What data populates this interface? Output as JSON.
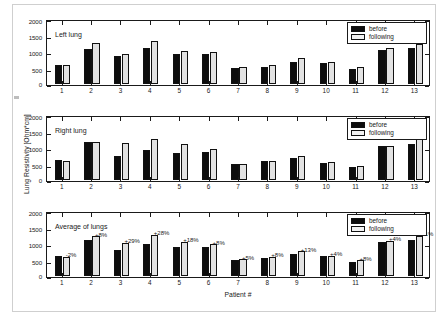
{
  "figure": {
    "yaxis_title": "Lung Resistivity [Ohm*cm]",
    "xaxis_title": "Patient #"
  },
  "legend": {
    "before_label": "before",
    "following_label": "following"
  },
  "panels": [
    {
      "title": "Left lung"
    },
    {
      "title": "Right lung"
    },
    {
      "title": "Average of lungs"
    }
  ],
  "chart_data": [
    {
      "type": "bar",
      "title": "Left lung",
      "xlabel": "Patient #",
      "ylabel": "Lung Resistivity [Ohm*cm]",
      "ylim": [
        0,
        2000
      ],
      "yticks": [
        0,
        500,
        1000,
        1500,
        2000
      ],
      "ytick_labels": [
        "0",
        "500",
        "1000",
        "1500",
        "2000"
      ],
      "categories": [
        "1",
        "2",
        "3",
        "4",
        "5",
        "6",
        "7",
        "8",
        "9",
        "10",
        "11",
        "12",
        "13"
      ],
      "grid": false,
      "legend_position": "top-right",
      "series": [
        {
          "name": "before",
          "values": [
            600,
            1100,
            870,
            1115,
            950,
            930,
            510,
            545,
            690,
            670,
            470,
            1050,
            1140
          ]
        },
        {
          "name": "following",
          "values": [
            595,
            1285,
            940,
            1330,
            1025,
            1005,
            525,
            600,
            820,
            700,
            520,
            1130,
            1260
          ]
        }
      ]
    },
    {
      "type": "bar",
      "title": "Right lung",
      "xlabel": "Patient #",
      "ylabel": "Lung Resistivity [Ohm*cm]",
      "ylim": [
        0,
        2000
      ],
      "yticks": [
        0,
        500,
        1000,
        1500,
        2000
      ],
      "ytick_labels": [
        "0",
        "500",
        "1000",
        "1500",
        "2000"
      ],
      "categories": [
        "1",
        "2",
        "3",
        "4",
        "5",
        "6",
        "7",
        "8",
        "9",
        "10",
        "11",
        "12",
        "13"
      ],
      "grid": false,
      "legend_position": "top-right",
      "series": [
        {
          "name": "before",
          "values": [
            620,
            1175,
            745,
            925,
            855,
            880,
            485,
            580,
            685,
            545,
            420,
            1060,
            1140
          ]
        },
        {
          "name": "following",
          "values": [
            605,
            1190,
            1145,
            1275,
            1120,
            975,
            510,
            605,
            735,
            575,
            435,
            1060,
            1280
          ]
        }
      ]
    },
    {
      "type": "bar",
      "title": "Average of lungs",
      "xlabel": "Patient #",
      "ylabel": "Lung Resistivity [Ohm*cm]",
      "ylim": [
        0,
        2000
      ],
      "yticks": [
        0,
        500,
        1000,
        1500,
        2000
      ],
      "ytick_labels": [
        "0",
        "500",
        "1000",
        "1500",
        "2000"
      ],
      "categories": [
        "1",
        "2",
        "3",
        "4",
        "5",
        "6",
        "7",
        "8",
        "9",
        "10",
        "11",
        "12",
        "13"
      ],
      "grid": false,
      "legend_position": "top-right",
      "series": [
        {
          "name": "before",
          "values": [
            610,
            1140,
            805,
            1005,
            900,
            910,
            495,
            560,
            690,
            610,
            450,
            1055,
            1140
          ]
        },
        {
          "name": "following",
          "values": [
            600,
            1235,
            1040,
            1290,
            1065,
            985,
            520,
            605,
            780,
            635,
            485,
            1095,
            1265
          ]
        }
      ],
      "annotations": [
        "-2%",
        "+8%",
        "+29%",
        "+28%",
        "+18%",
        "+8%",
        "+5%",
        "+8%",
        "+13%",
        "+4%",
        "+8%",
        "+4%",
        "+11%"
      ]
    }
  ]
}
